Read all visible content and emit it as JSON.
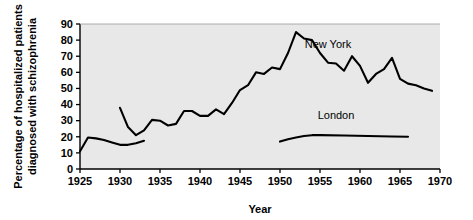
{
  "chart_data": {
    "type": "line",
    "title": "",
    "xlabel": "Year",
    "ylabel": "Percentage of hospitalized patients diagnosed with schizophrenia",
    "ylabel_line1": "Percentage of hospitalized patients",
    "ylabel_line2": "diagnosed with schizophrenia",
    "xlim": [
      1925,
      1970
    ],
    "ylim": [
      0,
      90
    ],
    "xticks": [
      1925,
      1930,
      1935,
      1940,
      1945,
      1950,
      1955,
      1960,
      1965,
      1970
    ],
    "yticks": [
      0,
      10,
      20,
      30,
      40,
      50,
      60,
      70,
      80,
      90
    ],
    "grid": false,
    "legend_position": "inline-labels",
    "plot_background": "#e8e8e8",
    "line_color": "#000000",
    "series": [
      {
        "name": "New York",
        "label": "New York",
        "label_x": 1956,
        "label_y": 75,
        "segments": [
          {
            "id": "new-york-early",
            "x": [
              1925,
              1926,
              1927,
              1928,
              1929,
              1930,
              1931,
              1932,
              1933
            ],
            "y": [
              11,
              19.5,
              19,
              18,
              16.5,
              15,
              15,
              16,
              17.5
            ]
          },
          {
            "id": "new-york-main",
            "x": [
              1930,
              1931,
              1932,
              1933,
              1934,
              1935,
              1936,
              1937,
              1938,
              1939,
              1940,
              1941,
              1942,
              1943,
              1944,
              1945,
              1946,
              1947,
              1948,
              1949,
              1950,
              1951,
              1952,
              1953,
              1954,
              1955,
              1956,
              1957,
              1958,
              1959,
              1960,
              1961,
              1962,
              1963,
              1964,
              1965,
              1966,
              1967,
              1968,
              1969
            ],
            "y": [
              38,
              26,
              21,
              24,
              30.5,
              30,
              27,
              28,
              36,
              36,
              33,
              33,
              37,
              34,
              41,
              49,
              52,
              60,
              59,
              63,
              62,
              72,
              85,
              81,
              80,
              72,
              66,
              65.5,
              61,
              70,
              64,
              53.5,
              59,
              62,
              69,
              56,
              53,
              52,
              50,
              48.5
            ]
          }
        ]
      },
      {
        "name": "London",
        "label": "London",
        "label_x": 1957,
        "label_y": 31,
        "segments": [
          {
            "id": "london-main",
            "x": [
              1950,
              1951,
              1952,
              1953,
              1954,
              1955,
              1958,
              1961,
              1964,
              1966
            ],
            "y": [
              17,
              18.5,
              19.5,
              20.5,
              21,
              21,
              20.8,
              20.5,
              20.2,
              20
            ]
          }
        ]
      }
    ]
  }
}
